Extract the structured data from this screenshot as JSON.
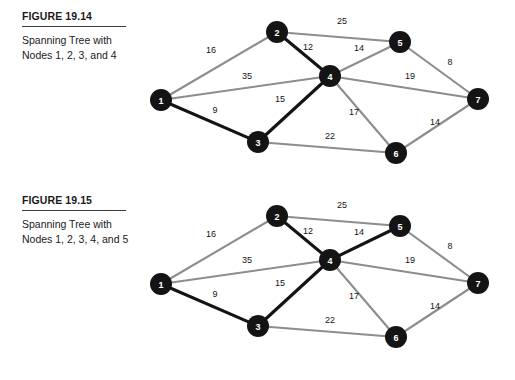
{
  "page": {
    "background": "#ffffff",
    "node_fill": "#141414",
    "node_text": "#ffffff",
    "edge_gray": "#8d8d8d",
    "edge_black": "#141414"
  },
  "figures": [
    {
      "id": "figure-19-14",
      "title": "FIGURE 19.14",
      "description": "Spanning Tree with Nodes 1, 2, 3, and 4",
      "nodes": [
        {
          "id": "1",
          "label": "1",
          "x": 31,
          "y": 100
        },
        {
          "id": "2",
          "label": "2",
          "x": 147,
          "y": 32
        },
        {
          "id": "3",
          "label": "3",
          "x": 128,
          "y": 142
        },
        {
          "id": "4",
          "label": "4",
          "x": 200,
          "y": 76
        },
        {
          "id": "5",
          "label": "5",
          "x": 270,
          "y": 42
        },
        {
          "id": "6",
          "label": "6",
          "x": 266,
          "y": 153
        },
        {
          "id": "7",
          "label": "7",
          "x": 348,
          "y": 99
        }
      ],
      "edges": [
        {
          "from": "1",
          "to": "2",
          "weight": "16",
          "style": "gray",
          "lx": 81,
          "ly": 50
        },
        {
          "from": "1",
          "to": "4",
          "weight": "35",
          "style": "gray",
          "lx": 117,
          "ly": 76
        },
        {
          "from": "1",
          "to": "3",
          "weight": "9",
          "style": "black",
          "lx": 85,
          "ly": 110
        },
        {
          "from": "2",
          "to": "5",
          "weight": "25",
          "style": "gray",
          "lx": 212,
          "ly": 21
        },
        {
          "from": "2",
          "to": "4",
          "weight": "12",
          "style": "black",
          "lx": 178,
          "ly": 47
        },
        {
          "from": "3",
          "to": "4",
          "weight": "15",
          "style": "black",
          "lx": 150,
          "ly": 99
        },
        {
          "from": "3",
          "to": "6",
          "weight": "22",
          "style": "gray",
          "lx": 200,
          "ly": 136
        },
        {
          "from": "4",
          "to": "5",
          "weight": "14",
          "style": "gray",
          "lx": 229,
          "ly": 48
        },
        {
          "from": "4",
          "to": "7",
          "weight": "19",
          "style": "gray",
          "lx": 280,
          "ly": 76
        },
        {
          "from": "4",
          "to": "6",
          "weight": "17",
          "style": "gray",
          "lx": 224,
          "ly": 112
        },
        {
          "from": "5",
          "to": "7",
          "weight": "8",
          "style": "gray",
          "lx": 320,
          "ly": 62
        },
        {
          "from": "6",
          "to": "7",
          "weight": "14",
          "style": "gray",
          "lx": 305,
          "ly": 122
        }
      ]
    },
    {
      "id": "figure-19-15",
      "title": "FIGURE 19.15",
      "description": "Spanning Tree with Nodes 1, 2, 3, 4, and 5",
      "nodes": [
        {
          "id": "1",
          "label": "1",
          "x": 31,
          "y": 100
        },
        {
          "id": "2",
          "label": "2",
          "x": 147,
          "y": 32
        },
        {
          "id": "3",
          "label": "3",
          "x": 128,
          "y": 142
        },
        {
          "id": "4",
          "label": "4",
          "x": 200,
          "y": 76
        },
        {
          "id": "5",
          "label": "5",
          "x": 270,
          "y": 42
        },
        {
          "id": "6",
          "label": "6",
          "x": 266,
          "y": 153
        },
        {
          "id": "7",
          "label": "7",
          "x": 348,
          "y": 99
        }
      ],
      "edges": [
        {
          "from": "1",
          "to": "2",
          "weight": "16",
          "style": "gray",
          "lx": 81,
          "ly": 50
        },
        {
          "from": "1",
          "to": "4",
          "weight": "35",
          "style": "gray",
          "lx": 117,
          "ly": 76
        },
        {
          "from": "1",
          "to": "3",
          "weight": "9",
          "style": "black",
          "lx": 85,
          "ly": 110
        },
        {
          "from": "2",
          "to": "5",
          "weight": "25",
          "style": "gray",
          "lx": 212,
          "ly": 21
        },
        {
          "from": "2",
          "to": "4",
          "weight": "12",
          "style": "black",
          "lx": 178,
          "ly": 47
        },
        {
          "from": "3",
          "to": "4",
          "weight": "15",
          "style": "black",
          "lx": 150,
          "ly": 99
        },
        {
          "from": "3",
          "to": "6",
          "weight": "22",
          "style": "gray",
          "lx": 200,
          "ly": 136
        },
        {
          "from": "4",
          "to": "5",
          "weight": "14",
          "style": "black",
          "lx": 229,
          "ly": 48
        },
        {
          "from": "4",
          "to": "7",
          "weight": "19",
          "style": "gray",
          "lx": 280,
          "ly": 76
        },
        {
          "from": "4",
          "to": "6",
          "weight": "17",
          "style": "gray",
          "lx": 224,
          "ly": 112
        },
        {
          "from": "5",
          "to": "7",
          "weight": "8",
          "style": "gray",
          "lx": 320,
          "ly": 62
        },
        {
          "from": "6",
          "to": "7",
          "weight": "14",
          "style": "gray",
          "lx": 305,
          "ly": 122
        }
      ]
    }
  ],
  "node_radius": 11
}
